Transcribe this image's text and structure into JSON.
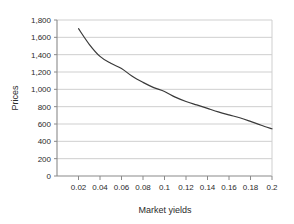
{
  "chart_data": {
    "type": "line",
    "title": "",
    "xlabel": "Market yields",
    "ylabel": "Prices",
    "xlim": [
      0,
      0.2
    ],
    "ylim": [
      0,
      1800
    ],
    "grid": "horizontal",
    "legend": "none",
    "x_ticks": [
      0.02,
      0.04,
      0.06,
      0.08,
      0.1,
      0.12,
      0.14,
      0.16,
      0.18,
      0.2
    ],
    "x_tick_labels": [
      "0.02",
      "0.04",
      "0.06",
      "0.08",
      "0.1",
      "0.12",
      "0.14",
      "0.16",
      "0.18",
      "0.2"
    ],
    "y_ticks": [
      0,
      200,
      400,
      600,
      800,
      1000,
      1200,
      1400,
      1600,
      1800
    ],
    "y_tick_labels": [
      "0",
      "200",
      "400",
      "600",
      "800",
      "1,000",
      "1,200",
      "1,400",
      "1,600",
      "1,800"
    ],
    "series": [
      {
        "name": "Price-yield curve",
        "color": "#3a3a3a",
        "x": [
          0.02,
          0.03,
          0.04,
          0.05,
          0.06,
          0.07,
          0.08,
          0.09,
          0.1,
          0.11,
          0.12,
          0.13,
          0.14,
          0.15,
          0.16,
          0.17,
          0.18,
          0.19,
          0.2
        ],
        "values": [
          1700,
          1520,
          1380,
          1300,
          1240,
          1150,
          1080,
          1020,
          975,
          910,
          860,
          820,
          780,
          740,
          705,
          672,
          630,
          585,
          545
        ]
      }
    ]
  },
  "axis": {
    "y_title": "Prices",
    "x_title": "Market yields"
  },
  "colors": {
    "curve": "#3a3a3a",
    "grid": "#c9c9c9",
    "axis": "#8a8a8a",
    "text": "#2b2b2b",
    "background": "#ffffff"
  }
}
